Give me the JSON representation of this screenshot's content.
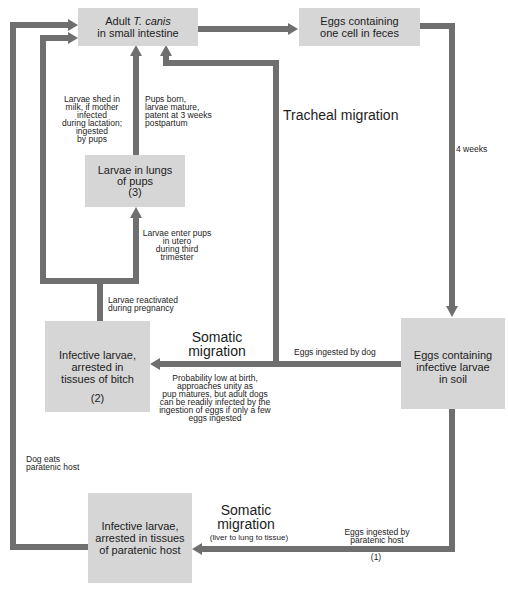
{
  "nodes": {
    "adult": {
      "prefix": "Adult",
      "italic": "T. canis",
      "line2": "in small intestine"
    },
    "eggs_feces": {
      "lines": [
        "Eggs containing",
        "one cell in feces"
      ]
    },
    "pups_lungs": {
      "lines": [
        "Larvae in lungs",
        "of pups",
        "(3)"
      ]
    },
    "bitch": {
      "lines": [
        "Infective larvae,",
        "arrested in",
        "tissues of bitch"
      ],
      "number": "(2)"
    },
    "soil": {
      "lines": [
        "Eggs containing",
        "infective larvae",
        "in soil"
      ]
    },
    "paratenic": {
      "lines": [
        "Infective larvae,",
        "arrested in tissues",
        "of paratenic host"
      ]
    }
  },
  "labels": {
    "milk": [
      "Larvae shed in",
      "milk, if mother",
      "infected",
      "during lactation;",
      "ingested",
      "by pups"
    ],
    "pups_born": [
      "Pups born,",
      "larvae mature,",
      "patent at 3 weeks",
      "postpartum"
    ],
    "tracheal": "Tracheal migration",
    "four_weeks": "4 weeks",
    "in_utero": [
      "Larvae enter pups",
      "in utero",
      "during third",
      "trimester"
    ],
    "reactivated": [
      "Larvae reactivated",
      "during pregnancy"
    ],
    "somatic_top": [
      "Somatic",
      "migration"
    ],
    "eggs_dog": "Eggs ingested by dog",
    "probability": [
      "Probability low at birth,",
      "approaches unity as",
      "pup matures, but adult dogs",
      "can be readily infected by the",
      "ingestion of eggs if only a few",
      "eggs ingested"
    ],
    "dog_eats": [
      "Dog eats",
      "paratenic host"
    ],
    "somatic_bottom": [
      "Somatic",
      "migration"
    ],
    "liver": "(liver to lung to tissue)",
    "eggs_paratenic": [
      "Eggs ingested by",
      "paratenic host"
    ],
    "path_one": "(1)"
  },
  "colors": {
    "background": "#ffffff",
    "box_fill": "#d6d6d6",
    "arrow": "#6f6f6f",
    "text": "#1c1c1c"
  }
}
